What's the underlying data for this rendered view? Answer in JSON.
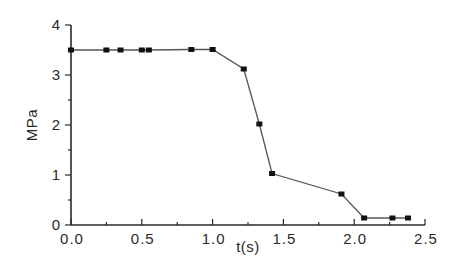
{
  "chart_data": {
    "type": "line",
    "title": "",
    "xlabel": "t(s)",
    "ylabel": "MPa",
    "xlim": [
      0,
      2.5
    ],
    "ylim": [
      0,
      4
    ],
    "x_ticks": [
      "0.0",
      "0.5",
      "1.0",
      "1.5",
      "2.0",
      "2.5"
    ],
    "y_ticks": [
      "0",
      "1",
      "2",
      "3",
      "4"
    ],
    "grid": false,
    "legend": null,
    "series": [
      {
        "name": "pressure",
        "marker": "square",
        "color": "#111111",
        "x": [
          0.0,
          0.25,
          0.35,
          0.5,
          0.55,
          0.85,
          1.0,
          1.22,
          1.33,
          1.42,
          1.91,
          2.07,
          2.27,
          2.38
        ],
        "y": [
          3.5,
          3.5,
          3.5,
          3.5,
          3.5,
          3.51,
          3.51,
          3.12,
          2.02,
          1.03,
          0.62,
          0.14,
          0.14,
          0.14
        ]
      }
    ]
  },
  "plot": {
    "origin_px": [
      71,
      225
    ],
    "x_px_per_unit": 141.6,
    "y_px_per_unit": 50
  }
}
